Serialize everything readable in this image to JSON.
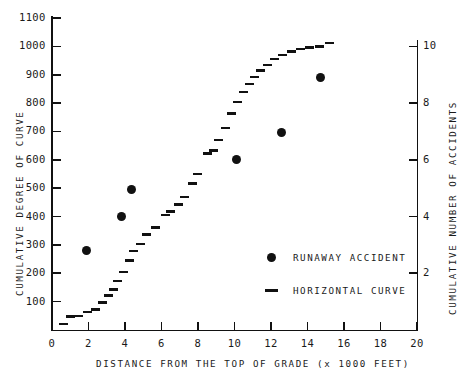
{
  "chart_data": {
    "type": "scatter",
    "title": "",
    "xlabel": "DISTANCE FROM THE TOP OF GRADE (x 1000 FEET)",
    "ylabel": "CUMULATIVE DEGREE OF CURVE",
    "y2label": "CUMULATIVE NUMBER OF ACCIDENTS",
    "xlim": [
      0,
      20
    ],
    "ylim": [
      0,
      1100
    ],
    "y2lim": [
      0,
      11
    ],
    "grid": false,
    "xticks": [
      0,
      2,
      4,
      6,
      8,
      10,
      12,
      14,
      16,
      18,
      20
    ],
    "xticklabels": [
      "0",
      "2",
      "4",
      "6",
      "8",
      "10",
      "12",
      "14",
      "16",
      "18",
      "20"
    ],
    "xminorticks": [
      1,
      3,
      5,
      7,
      9,
      11,
      13,
      15,
      17,
      19
    ],
    "yticks": [
      100,
      200,
      300,
      400,
      500,
      600,
      700,
      800,
      900,
      1000,
      1100
    ],
    "yticklabels": [
      "100",
      "200",
      "300",
      "400",
      "500",
      "600",
      "700",
      "800",
      "900",
      "1000",
      "1100"
    ],
    "y2ticks": [
      2,
      4,
      6,
      8,
      10
    ],
    "y2ticklabels": [
      "2",
      "4",
      "6",
      "8",
      "10"
    ],
    "legend_position": "lower-right",
    "series": [
      {
        "name": "RUNAWAY ACCIDENT",
        "marker": "filled-circle",
        "axis": "right",
        "color": "#111111",
        "points": [
          {
            "x": 1.9,
            "y": 2.8
          },
          {
            "x": 3.8,
            "y": 4.0
          },
          {
            "x": 4.35,
            "y": 4.95
          },
          {
            "x": 10.1,
            "y": 6.0
          },
          {
            "x": 12.6,
            "y": 6.95
          },
          {
            "x": 14.7,
            "y": 8.9
          }
        ]
      },
      {
        "name": "HORIZONTAL CURVE",
        "marker": "short-dash",
        "axis": "left",
        "color": "#111111",
        "points": [
          {
            "x": 0.65,
            "y": 22
          },
          {
            "x": 1.05,
            "y": 48
          },
          {
            "x": 1.45,
            "y": 50
          },
          {
            "x": 1.95,
            "y": 63
          },
          {
            "x": 2.4,
            "y": 72
          },
          {
            "x": 2.8,
            "y": 97
          },
          {
            "x": 3.1,
            "y": 122
          },
          {
            "x": 3.4,
            "y": 143
          },
          {
            "x": 3.6,
            "y": 172
          },
          {
            "x": 3.9,
            "y": 205
          },
          {
            "x": 4.25,
            "y": 245
          },
          {
            "x": 4.5,
            "y": 278
          },
          {
            "x": 4.85,
            "y": 303
          },
          {
            "x": 5.2,
            "y": 337
          },
          {
            "x": 5.7,
            "y": 362
          },
          {
            "x": 6.2,
            "y": 405
          },
          {
            "x": 6.5,
            "y": 418
          },
          {
            "x": 6.95,
            "y": 443
          },
          {
            "x": 7.25,
            "y": 470
          },
          {
            "x": 7.7,
            "y": 517
          },
          {
            "x": 8.0,
            "y": 551
          },
          {
            "x": 8.55,
            "y": 622
          },
          {
            "x": 8.85,
            "y": 633
          },
          {
            "x": 9.15,
            "y": 670
          },
          {
            "x": 9.5,
            "y": 712
          },
          {
            "x": 9.85,
            "y": 763
          },
          {
            "x": 10.15,
            "y": 803
          },
          {
            "x": 10.5,
            "y": 840
          },
          {
            "x": 10.8,
            "y": 868
          },
          {
            "x": 11.1,
            "y": 893
          },
          {
            "x": 11.45,
            "y": 915
          },
          {
            "x": 11.8,
            "y": 935
          },
          {
            "x": 12.2,
            "y": 955
          },
          {
            "x": 12.65,
            "y": 970
          },
          {
            "x": 13.1,
            "y": 982
          },
          {
            "x": 13.6,
            "y": 990
          },
          {
            "x": 14.1,
            "y": 996
          },
          {
            "x": 14.65,
            "y": 1000
          },
          {
            "x": 15.2,
            "y": 1012
          }
        ]
      }
    ]
  },
  "legend": {
    "items": [
      {
        "label": "RUNAWAY ACCIDENT",
        "marker": "filled-circle"
      },
      {
        "label": "HORIZONTAL CURVE",
        "marker": "short-dash"
      }
    ]
  }
}
